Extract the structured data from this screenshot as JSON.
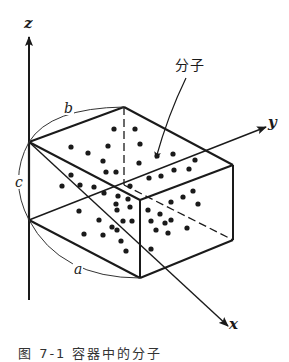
{
  "diagram": {
    "type": "3d-box-with-molecules",
    "axes": {
      "z": {
        "label": "z"
      },
      "y": {
        "label": "y"
      },
      "x": {
        "label": "x"
      }
    },
    "dimensions": {
      "a": "a",
      "b": "b",
      "c": "c"
    },
    "annotation": {
      "molecule_label": "分子"
    },
    "caption": "图 7-1  容器中的分子",
    "colors": {
      "ink": "#1a1a1a",
      "background": "#ffffff"
    }
  }
}
